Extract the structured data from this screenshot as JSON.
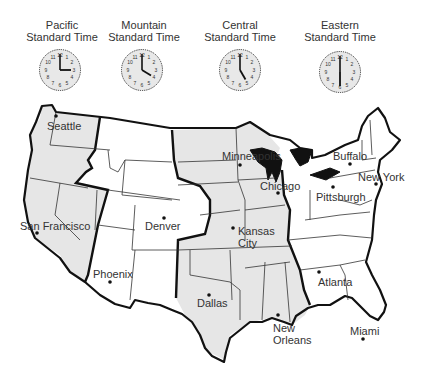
{
  "zones": [
    {
      "name_line1": "Pacific",
      "name_line2": "Standard Time",
      "time": "3:00",
      "hour": 3,
      "minute": 0
    },
    {
      "name_line1": "Mountain",
      "name_line2": "Standard Time",
      "time": "4:00",
      "hour": 4,
      "minute": 0
    },
    {
      "name_line1": "Central",
      "name_line2": "Standard Time",
      "time": "5:00",
      "hour": 5,
      "minute": 0
    },
    {
      "name_line1": "Eastern",
      "name_line2": "Standard Time",
      "time": "6:00",
      "hour": 6,
      "minute": 0
    }
  ],
  "cities": {
    "seattle": "Seattle",
    "san_francisco": "San Francisco",
    "phoenix": "Phoenix",
    "denver": "Denver",
    "dallas": "Dallas",
    "minneapolis": "Minneapolis",
    "chicago": "Chicago",
    "kansas_city_1": "Kansas",
    "kansas_city_2": "City",
    "new_orleans_1": "New",
    "new_orleans_2": "Orleans",
    "buffalo": "Buffalo",
    "pittsburgh": "Pittsburgh",
    "new_york": "New York",
    "atlanta": "Atlanta",
    "miami": "Miami"
  },
  "colors": {
    "pacific_fill": "#e6e6e6",
    "mountain_fill": "#ffffff",
    "central_fill": "#e6e6e6",
    "eastern_fill": "#ffffff",
    "border": "#111111"
  }
}
